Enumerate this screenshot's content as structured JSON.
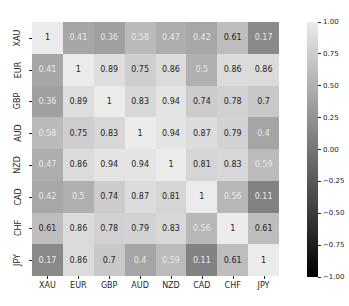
{
  "chart_data": {
    "type": "heatmap",
    "title": "",
    "xlabel": "",
    "ylabel": "",
    "labels": [
      "XAU",
      "EUR",
      "GBP",
      "AUD",
      "NZD",
      "CAD",
      "CHF",
      "JPY"
    ],
    "values": [
      [
        1,
        0.41,
        0.36,
        0.58,
        0.47,
        0.42,
        0.61,
        0.17
      ],
      [
        0.41,
        1,
        0.89,
        0.75,
        0.86,
        0.5,
        0.86,
        0.86
      ],
      [
        0.36,
        0.89,
        1,
        0.83,
        0.94,
        0.74,
        0.78,
        0.7
      ],
      [
        0.58,
        0.75,
        0.83,
        1,
        0.94,
        0.87,
        0.79,
        0.4
      ],
      [
        0.47,
        0.86,
        0.94,
        0.94,
        1,
        0.81,
        0.83,
        0.59
      ],
      [
        0.42,
        0.5,
        0.74,
        0.87,
        0.81,
        1,
        0.56,
        0.11
      ],
      [
        0.61,
        0.86,
        0.78,
        0.79,
        0.83,
        0.56,
        1,
        0.61
      ],
      [
        0.17,
        0.86,
        0.7,
        0.4,
        0.59,
        0.11,
        0.61,
        1
      ]
    ],
    "annotated": true,
    "colormap": "gray",
    "vmin": -1.0,
    "vmax": 1.0,
    "colorbar": {
      "ticks": [
        "1.00",
        "0.75",
        "0.50",
        "0.25",
        "0.00",
        "−0.25",
        "−0.50",
        "−0.75",
        "−1.00"
      ],
      "position": "right"
    },
    "grid": false
  }
}
